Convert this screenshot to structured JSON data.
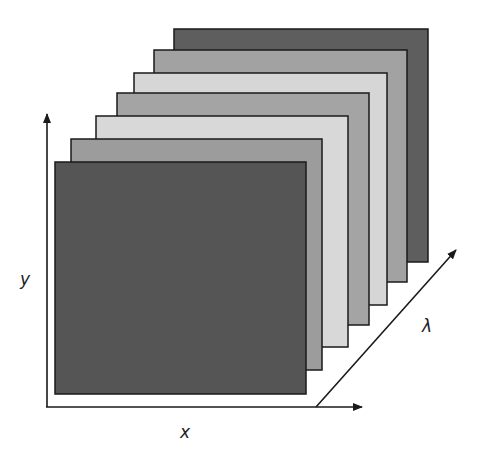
{
  "diagram": {
    "axes": {
      "x_label": "x",
      "y_label": "y",
      "lambda_label": "λ"
    },
    "colors": {
      "dark": "#565656",
      "mid": "#9a9a9a",
      "light": "#d2d2d2",
      "stroke": "#1a1a1a"
    },
    "panels": [
      {
        "name": "band-7",
        "x": 174,
        "y": 29,
        "w": 254,
        "h": 233,
        "shade": "#5e5e5e"
      },
      {
        "name": "band-6",
        "x": 154,
        "y": 50,
        "w": 253,
        "h": 232,
        "shade": "#a2a2a2"
      },
      {
        "name": "band-5",
        "x": 134,
        "y": 73,
        "w": 253,
        "h": 232,
        "shade": "#d6d6d6"
      },
      {
        "name": "band-4",
        "x": 117,
        "y": 93,
        "w": 252,
        "h": 232,
        "shade": "#a4a4a4"
      },
      {
        "name": "band-3",
        "x": 96,
        "y": 116,
        "w": 252,
        "h": 231,
        "shade": "#d8d8d8"
      },
      {
        "name": "band-2",
        "x": 71,
        "y": 139,
        "w": 251,
        "h": 231,
        "shade": "#9c9c9c"
      },
      {
        "name": "band-1",
        "x": 55,
        "y": 162,
        "w": 251,
        "h": 232,
        "shade": "#555555"
      }
    ]
  }
}
